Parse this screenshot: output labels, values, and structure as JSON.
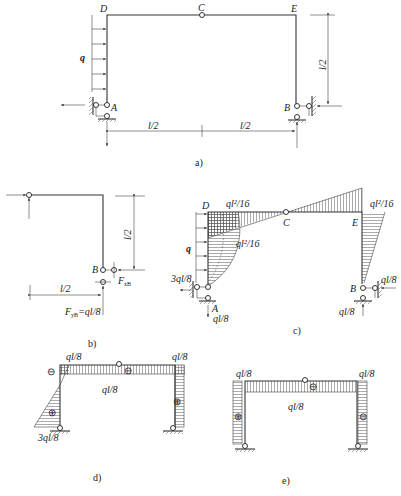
{
  "figure": {
    "panels": [
      {
        "id": "a",
        "caption": "a)",
        "description": "Three-hinged frame with distributed load q on left column",
        "labels": {
          "D": "D",
          "C": "C",
          "E": "E",
          "A": "A",
          "B": "B",
          "load": "q"
        },
        "dimensions": {
          "left_span": "l/2",
          "right_span": "l/2",
          "height": "l/2"
        }
      },
      {
        "id": "b",
        "caption": "b)",
        "description": "Free body of right part CEB",
        "labels": {
          "B": "B",
          "FxB": "F",
          "FxB_sub": "xB",
          "FyB": "F",
          "FyB_sub": "yB",
          "FyB_val": "=ql/8"
        },
        "dimensions": {
          "span": "l/2",
          "height": "l/2"
        }
      },
      {
        "id": "c",
        "caption": "c)",
        "description": "Bending moment diagram",
        "labels": {
          "D": "D",
          "C": "C",
          "E": "E",
          "A": "A",
          "B": "B",
          "load": "q",
          "M_D": "ql²/16",
          "M_mid": "ql²/16",
          "M_E": "ql²/16",
          "R_Ax": "3ql/8",
          "R_Ay": "ql/8",
          "R_Bx": "ql/8",
          "R_By": "ql/8"
        }
      },
      {
        "id": "d",
        "caption": "d)",
        "description": "Shear force diagram",
        "labels": {
          "top_left": "ql/8",
          "top_right": "ql/8",
          "beam": "ql/8",
          "bottom_left": "3ql/8",
          "signs": [
            "⊖",
            "⊖",
            "⊕",
            "⊕"
          ]
        }
      },
      {
        "id": "e",
        "caption": "e)",
        "description": "Axial force diagram",
        "labels": {
          "top_left": "ql/8",
          "top_right": "ql/8",
          "beam": "ql/8",
          "signs": [
            "⊕",
            "⊖",
            "⊖"
          ]
        }
      }
    ]
  }
}
